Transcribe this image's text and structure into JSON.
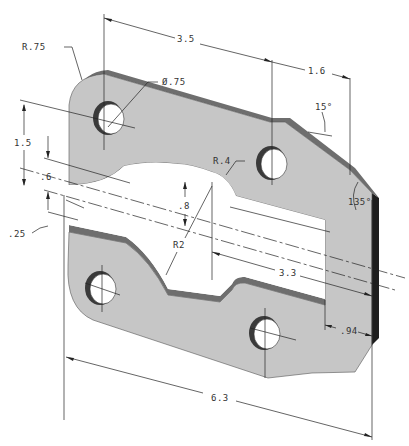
{
  "drawing": {
    "title": "Isometric plate with slot and four holes",
    "colors": {
      "face": "#c6c6c6",
      "top_edge": "#6e6e6e",
      "side": "#1e1e1e",
      "background": "#ffffff",
      "lines": "#222222"
    },
    "dimensions": {
      "corner_radius": "R.75",
      "hole_diameter": "Ø.75",
      "hole_spacing_top": "3.5",
      "chamfer_width": "1.6",
      "chamfer_angle": "15°",
      "corner_angle": "135°",
      "slot_radius": "R.4",
      "height_left": "1.5",
      "offset_mid": ".6",
      "slot_height": ".8",
      "thickness": ".25",
      "arc_radius": "R2",
      "slot_length": "3.3",
      "right_margin": ".94",
      "overall_length": "6.3"
    }
  }
}
